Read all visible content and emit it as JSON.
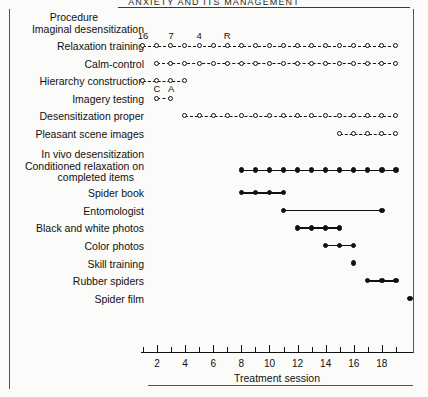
{
  "running_head": "ANXIETY AND ITS MANAGEMENT",
  "header": {
    "column_title": "Procedure"
  },
  "axis": {
    "title": "Treatment session",
    "min": 1,
    "max": 20,
    "tick_labels": [
      "2",
      "4",
      "6",
      "8",
      "10",
      "12",
      "14",
      "16",
      "18"
    ],
    "tick_values": [
      2,
      4,
      6,
      8,
      10,
      12,
      14,
      16,
      18
    ],
    "minor_tick_values": [
      1,
      3,
      5,
      7,
      9,
      11,
      13,
      15,
      17,
      19
    ]
  },
  "annotations": [
    {
      "text": "16",
      "session": 1,
      "row": "relaxation-training"
    },
    {
      "text": "7",
      "session": 3,
      "row": "relaxation-training"
    },
    {
      "text": "4",
      "session": 5,
      "row": "relaxation-training"
    },
    {
      "text": "R",
      "session": 7,
      "row": "relaxation-training"
    },
    {
      "text": "C",
      "session": 2,
      "row": "imagery-testing"
    },
    {
      "text": "A",
      "session": 3,
      "row": "imagery-testing"
    }
  ],
  "groups": [
    {
      "name": "Imaginal desensitization",
      "id": "imaginal-desensitization",
      "rows": [
        {
          "label": "Relaxation training",
          "id": "relaxation-training",
          "marker": "open",
          "line": "dashed",
          "sessions": [
            1,
            2,
            3,
            4,
            5,
            6,
            7,
            8,
            9,
            10,
            11,
            12,
            13,
            14,
            15,
            16,
            17,
            18,
            19
          ]
        },
        {
          "label": "Calm-control",
          "id": "calm-control",
          "marker": "open",
          "line": "dashed",
          "sessions": [
            2,
            3,
            4,
            5,
            6,
            7,
            8,
            9,
            10,
            11,
            12,
            13,
            14,
            15,
            16,
            17,
            18,
            19
          ]
        },
        {
          "label": "Hierarchy construction",
          "id": "hierarchy-construction",
          "marker": "open",
          "line": "dashed",
          "sessions": [
            1,
            2,
            3,
            4
          ]
        },
        {
          "label": "Imagery testing",
          "id": "imagery-testing",
          "marker": "open",
          "line": "dashed",
          "sessions": [
            2,
            3
          ]
        },
        {
          "label": "Desensitization proper",
          "id": "desensitization-proper",
          "marker": "open",
          "line": "dashed",
          "sessions": [
            4,
            5,
            6,
            7,
            8,
            9,
            10,
            11,
            12,
            13,
            14,
            15,
            16,
            17,
            18,
            19
          ]
        },
        {
          "label": "Pleasant scene images",
          "id": "pleasant-scene-images",
          "marker": "open",
          "line": "dashed",
          "sessions": [
            15,
            16,
            17,
            18,
            19
          ]
        }
      ]
    },
    {
      "name": "In vivo desensitization",
      "id": "in-vivo-desensitization",
      "rows": [
        {
          "label": "Conditioned relaxation on",
          "label2": "completed items",
          "id": "conditioned-relaxation",
          "marker": "closed",
          "line": "solid",
          "sessions": [
            8,
            9,
            10,
            11,
            12,
            13,
            14,
            15,
            16,
            17,
            18,
            19
          ]
        },
        {
          "label": "Spider book",
          "id": "spider-book",
          "marker": "closed",
          "line": "solid",
          "sessions": [
            8,
            9,
            10,
            11
          ]
        },
        {
          "label": "Entomologist",
          "id": "entomologist",
          "marker": "closed",
          "line": "solid",
          "sessions": [
            11,
            18
          ],
          "endpoints_only": true
        },
        {
          "label": "Black and white photos",
          "id": "black-and-white-photos",
          "marker": "closed",
          "line": "solid",
          "sessions": [
            12,
            13,
            14,
            15
          ]
        },
        {
          "label": "Color photos",
          "id": "color-photos",
          "marker": "closed",
          "line": "solid",
          "sessions": [
            14,
            15,
            16
          ]
        },
        {
          "label": "Skill training",
          "id": "skill-training",
          "marker": "closed",
          "line": "none",
          "sessions": [
            16
          ]
        },
        {
          "label": "Rubber spiders",
          "id": "rubber-spiders",
          "marker": "closed",
          "line": "solid",
          "sessions": [
            17,
            18,
            19
          ]
        },
        {
          "label": "Spider film",
          "id": "spider-film",
          "marker": "closed",
          "line": "none",
          "sessions": [
            20
          ]
        }
      ]
    }
  ],
  "chart_data": {
    "type": "table",
    "xlabel": "Treatment session",
    "ylabel": "Procedure",
    "xlim": [
      1,
      20
    ],
    "grid": false,
    "legend": "none",
    "series": [
      {
        "name": "Relaxation training",
        "marker": "open-circle",
        "line": "dashed",
        "x": [
          1,
          2,
          3,
          4,
          5,
          6,
          7,
          8,
          9,
          10,
          11,
          12,
          13,
          14,
          15,
          16,
          17,
          18,
          19
        ]
      },
      {
        "name": "Calm-control",
        "marker": "open-circle",
        "line": "dashed",
        "x": [
          2,
          3,
          4,
          5,
          6,
          7,
          8,
          9,
          10,
          11,
          12,
          13,
          14,
          15,
          16,
          17,
          18,
          19
        ]
      },
      {
        "name": "Hierarchy construction",
        "marker": "open-circle",
        "line": "dashed",
        "x": [
          1,
          2,
          3,
          4
        ]
      },
      {
        "name": "Imagery testing",
        "marker": "open-circle",
        "line": "dashed",
        "x": [
          2,
          3
        ]
      },
      {
        "name": "Desensitization proper",
        "marker": "open-circle",
        "line": "dashed",
        "x": [
          4,
          5,
          6,
          7,
          8,
          9,
          10,
          11,
          12,
          13,
          14,
          15,
          16,
          17,
          18,
          19
        ]
      },
      {
        "name": "Pleasant scene images",
        "marker": "open-circle",
        "line": "dashed",
        "x": [
          15,
          16,
          17,
          18,
          19
        ]
      },
      {
        "name": "Conditioned relaxation on completed items",
        "marker": "filled-circle",
        "line": "solid",
        "x": [
          8,
          9,
          10,
          11,
          12,
          13,
          14,
          15,
          16,
          17,
          18,
          19
        ]
      },
      {
        "name": "Spider book",
        "marker": "filled-circle",
        "line": "solid",
        "x": [
          8,
          9,
          10,
          11
        ]
      },
      {
        "name": "Entomologist",
        "marker": "filled-circle",
        "line": "solid",
        "x": [
          11,
          18
        ]
      },
      {
        "name": "Black and white photos",
        "marker": "filled-circle",
        "line": "solid",
        "x": [
          12,
          13,
          14,
          15
        ]
      },
      {
        "name": "Color photos",
        "marker": "filled-circle",
        "line": "solid",
        "x": [
          14,
          15,
          16
        ]
      },
      {
        "name": "Skill training",
        "marker": "filled-circle",
        "line": "none",
        "x": [
          16
        ]
      },
      {
        "name": "Rubber spiders",
        "marker": "filled-circle",
        "line": "solid",
        "x": [
          17,
          18,
          19
        ]
      },
      {
        "name": "Spider film",
        "marker": "filled-circle",
        "line": "none",
        "x": [
          20
        ]
      }
    ],
    "annotations": [
      {
        "text": "16",
        "x": 1,
        "series": "Relaxation training"
      },
      {
        "text": "7",
        "x": 3,
        "series": "Relaxation training"
      },
      {
        "text": "4",
        "x": 5,
        "series": "Relaxation training"
      },
      {
        "text": "R",
        "x": 7,
        "series": "Relaxation training"
      },
      {
        "text": "C",
        "x": 2,
        "series": "Imagery testing"
      },
      {
        "text": "A",
        "x": 3,
        "series": "Imagery testing"
      }
    ]
  }
}
